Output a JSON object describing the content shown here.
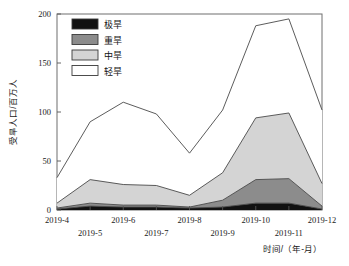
{
  "chart_data": {
    "type": "area",
    "stacked": true,
    "title": "",
    "xlabel": "时间/（年-月）",
    "ylabel": "受旱人口/百万人",
    "categories": [
      "2019-4",
      "2019-5",
      "2019-6",
      "2019-7",
      "2019-8",
      "2019-9",
      "2019-10",
      "2019-11",
      "2019-12"
    ],
    "xtick_labels": [
      "2019-4",
      "2019-5",
      "2019-6",
      "2019-7",
      "2019-8",
      "2019-9",
      "2019-10",
      "2019-11",
      "2019-12"
    ],
    "ytick_labels": [
      "0",
      "50",
      "100",
      "150",
      "200"
    ],
    "yticks": [
      0,
      50,
      100,
      150,
      200
    ],
    "ylim": [
      0,
      200
    ],
    "grid": false,
    "legend_position": "upper-left",
    "series": [
      {
        "name": "极旱",
        "color": "#111111",
        "values": [
          1,
          4,
          3,
          3,
          2,
          3,
          7,
          7,
          1
        ]
      },
      {
        "name": "重旱",
        "color": "#8c8c8c",
        "values": [
          1,
          3,
          2,
          2,
          1,
          7,
          24,
          25,
          3
        ]
      },
      {
        "name": "中旱",
        "color": "#d4d4d4",
        "values": [
          5,
          24,
          21,
          20,
          12,
          28,
          63,
          67,
          23
        ]
      },
      {
        "name": "轻旱",
        "color": "#ffffff",
        "values": [
          26,
          59,
          84,
          73,
          43,
          64,
          94,
          96,
          75
        ]
      }
    ],
    "totals": [
      33,
      90,
      110,
      98,
      58,
      102,
      188,
      195,
      102
    ]
  },
  "legend": {
    "items": [
      {
        "label": "极旱"
      },
      {
        "label": "重旱"
      },
      {
        "label": "中旱"
      },
      {
        "label": "轻旱"
      }
    ]
  }
}
